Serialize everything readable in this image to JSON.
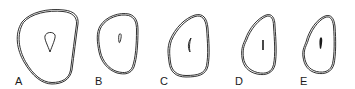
{
  "figure": {
    "panels": [
      {
        "label": "A",
        "label_x": 15,
        "label_y": 76
      },
      {
        "label": "B",
        "label_x": 95,
        "label_y": 76
      },
      {
        "label": "C",
        "label_x": 160,
        "label_y": 76
      },
      {
        "label": "D",
        "label_x": 235,
        "label_y": 76
      },
      {
        "label": "E",
        "label_x": 300,
        "label_y": 76
      }
    ],
    "stroke_color": "#1a1a1a",
    "background": "#ffffff"
  }
}
